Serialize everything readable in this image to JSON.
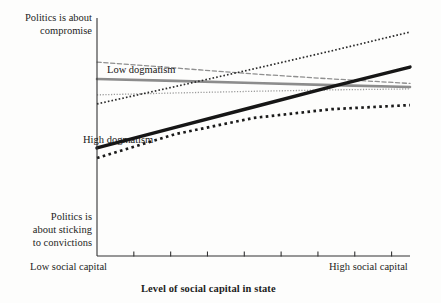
{
  "figure": {
    "background_color": "#fdfdfc",
    "axis_color": "#333333"
  },
  "axes": {
    "y_label_top": "Politics is about\ncompromise",
    "y_label_bottom": "Politics is\nabout sticking\nto convictions",
    "x_label_low": "Low social capital",
    "x_label_high": "High social capital",
    "x_axis_title": "Level of social capital in state",
    "x_tick_count": 8,
    "grid": "off"
  },
  "annotations": {
    "low_dogmatism": "Low dogmatism",
    "high_dogmatism": "High dogmatism"
  },
  "colors": {
    "high_dogmatism": "#161616",
    "low_dogmatism": "#8c8c8c",
    "high_ci": "#222222",
    "low_ci": "#8f8f8f",
    "axis": "#333333"
  },
  "chart_data": {
    "type": "line",
    "title": "",
    "subtitle": "",
    "xlabel": "Level of social capital in state",
    "ylabel": "",
    "xlim": [
      0,
      1
    ],
    "ylim": [
      0,
      1
    ],
    "x_tick_labels": [
      "Low social capital",
      "",
      "",
      "",
      "",
      "",
      "",
      "High social capital"
    ],
    "y_tick_labels": [
      "Politics is about sticking to convictions",
      "Politics is about compromise"
    ],
    "grid": false,
    "legend_position": "in-plot annotations",
    "annotations": [
      {
        "text": "Low dogmatism",
        "x": 0.05,
        "y": 0.82
      },
      {
        "text": "High dogmatism",
        "x": 0.0,
        "y": 0.52
      }
    ],
    "series": [
      {
        "name": "Low dogmatism",
        "role": "point-estimate",
        "style": "solid",
        "color": "#8c8c8c",
        "width": 2.6,
        "x": [
          0.0,
          0.25,
          0.5,
          0.75,
          1.0
        ],
        "y": [
          0.744,
          0.736,
          0.727,
          0.718,
          0.71
        ]
      },
      {
        "name": "Low dogmatism upper bound",
        "role": "confidence-upper",
        "style": "dashed",
        "color": "#8f8f8f",
        "width": 1.3,
        "x": [
          0.0,
          0.25,
          0.5,
          0.75,
          1.0
        ],
        "y": [
          0.815,
          0.79,
          0.765,
          0.744,
          0.725
        ]
      },
      {
        "name": "Low dogmatism lower bound",
        "role": "confidence-lower",
        "style": "dotted",
        "color": "#9a9a9a",
        "width": 1.3,
        "x": [
          0.0,
          0.25,
          0.5,
          0.75,
          1.0
        ],
        "y": [
          0.677,
          0.685,
          0.692,
          0.698,
          0.702
        ]
      },
      {
        "name": "High dogmatism",
        "role": "point-estimate",
        "style": "solid",
        "color": "#161616",
        "width": 3.4,
        "x": [
          0.0,
          0.25,
          0.5,
          0.75,
          1.0
        ],
        "y": [
          0.454,
          0.54,
          0.626,
          0.712,
          0.794
        ]
      },
      {
        "name": "High dogmatism upper bound",
        "role": "confidence-upper",
        "style": "dotted",
        "color": "#2a2a2a",
        "width": 1.7,
        "x": [
          0.0,
          0.25,
          0.5,
          0.75,
          1.0
        ],
        "y": [
          0.639,
          0.712,
          0.786,
          0.862,
          0.941
        ]
      },
      {
        "name": "High dogmatism lower bound",
        "role": "confidence-lower",
        "style": "dotted",
        "color": "#1a1a1a",
        "width": 2.7,
        "x": [
          0.0,
          0.25,
          0.5,
          0.75,
          1.0
        ],
        "y": [
          0.412,
          0.512,
          0.58,
          0.617,
          0.634
        ]
      }
    ]
  }
}
